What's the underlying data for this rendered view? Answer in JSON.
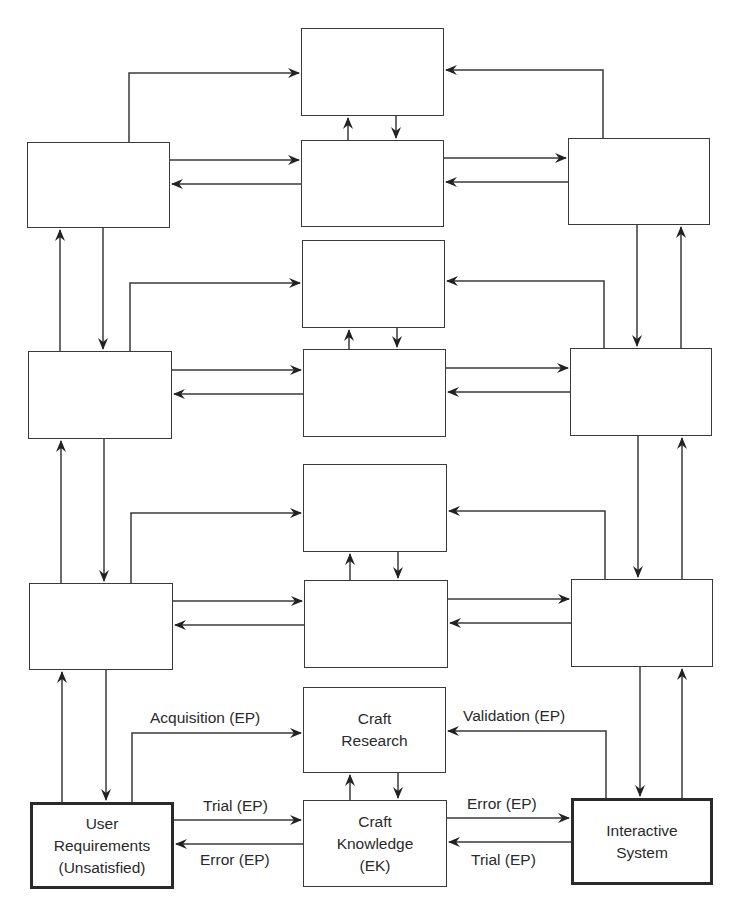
{
  "diagram": {
    "type": "iterative-craft-discipline-model",
    "levels": [
      {
        "left": "",
        "center_top": "",
        "center_bottom": "",
        "right": ""
      },
      {
        "left": "",
        "center_top": "",
        "center_bottom": "",
        "right": ""
      },
      {
        "left": "",
        "center_top": "",
        "center_bottom": "",
        "right": ""
      },
      {
        "left": [
          "User",
          "Requirements",
          "(Unsatisfied)"
        ],
        "center_top": [
          "Craft",
          "Research"
        ],
        "center_bottom": [
          "Craft",
          "Knowledge",
          "(EK)"
        ],
        "right": [
          "Interactive",
          "System"
        ]
      }
    ],
    "edge_labels": {
      "acquisition": "Acquisition (EP)",
      "validation": "Validation (EP)",
      "trial_left": "Trial (EP)",
      "error_left": "Error (EP)",
      "error_right": "Error (EP)",
      "trial_right": "Trial (EP)"
    },
    "colors": {
      "line": "#3a3a3a",
      "text": "#2a2a2a",
      "background": "#ffffff"
    }
  }
}
